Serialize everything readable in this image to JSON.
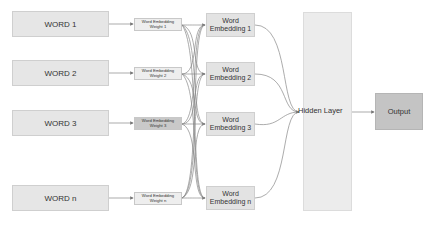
{
  "inputs": [
    {
      "label": "WORD 1",
      "weight_line1": "Word Embedding",
      "weight_line2": "Weight 1",
      "emb_line1": "Word",
      "emb_line2": "Embedding 1"
    },
    {
      "label": "WORD 2",
      "weight_line1": "Word Embedding",
      "weight_line2": "Weight 2",
      "emb_line1": "Word",
      "emb_line2": "Embedding 2"
    },
    {
      "label": "WORD 3",
      "weight_line1": "Word Embedding",
      "weight_line2": "Weight 3",
      "emb_line1": "Word",
      "emb_line2": "Embedding 3"
    },
    {
      "label": "WORD n",
      "weight_line1": "Word Embedding",
      "weight_line2": "Weight n",
      "emb_line1": "Word",
      "emb_line2": "Embedding n"
    }
  ],
  "hidden_layer": {
    "label": "Hidden Layer"
  },
  "output": {
    "label": "Output"
  },
  "colors": {
    "word_box": "#e6e6e6",
    "weight_box": "#eeeeee",
    "weight_box_highlight": "#c9c9c9",
    "embedding_box": "#e3e3e3",
    "hidden_layer": "#ececec",
    "output_box": "#c4c4c4",
    "connector": "#777777"
  }
}
